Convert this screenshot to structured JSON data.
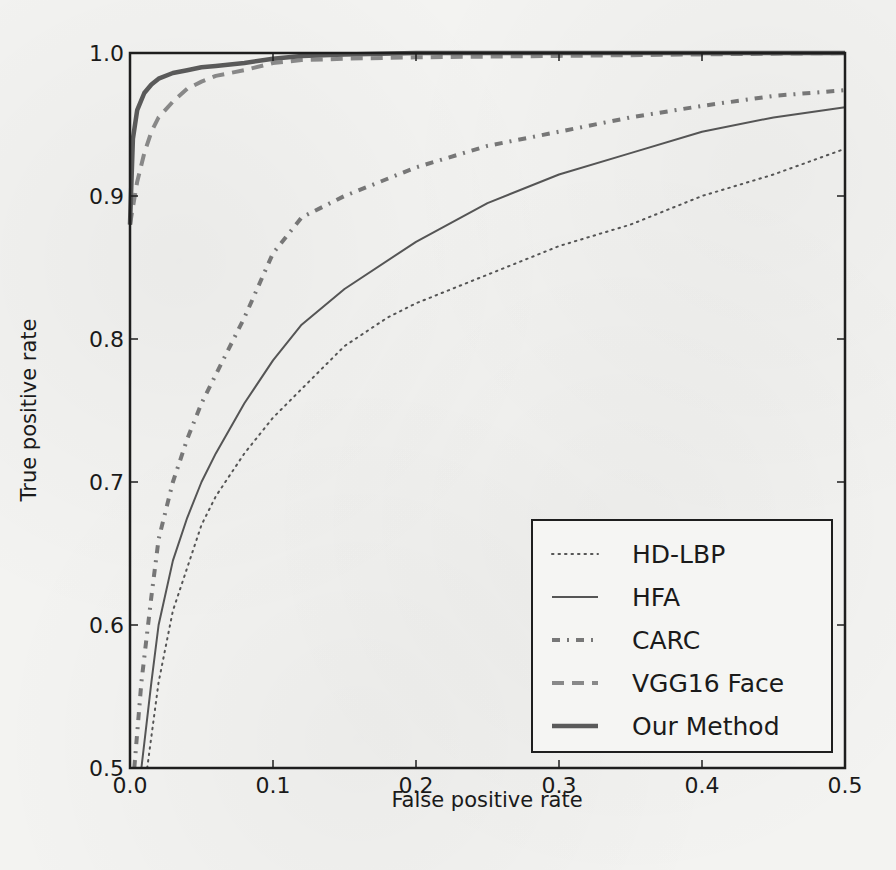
{
  "chart_data": {
    "type": "line",
    "title": "",
    "xlabel": "False positive rate",
    "ylabel": "True positive rate",
    "xlim": [
      0.0,
      0.5
    ],
    "ylim": [
      0.5,
      1.0
    ],
    "xticks": [
      "0.0",
      "0.1",
      "0.2",
      "0.3",
      "0.4",
      "0.5"
    ],
    "yticks": [
      "0.5",
      "0.6",
      "0.7",
      "0.8",
      "0.9",
      "1.0"
    ],
    "grid": false,
    "legend_position": "lower right",
    "series": [
      {
        "name": "HD-LBP",
        "style": "dotted",
        "color": "#555555",
        "x": [
          0.012,
          0.02,
          0.03,
          0.04,
          0.05,
          0.06,
          0.08,
          0.1,
          0.12,
          0.15,
          0.18,
          0.2,
          0.25,
          0.3,
          0.35,
          0.4,
          0.45,
          0.5
        ],
        "y": [
          0.5,
          0.56,
          0.61,
          0.64,
          0.67,
          0.69,
          0.72,
          0.745,
          0.765,
          0.795,
          0.815,
          0.825,
          0.845,
          0.865,
          0.88,
          0.9,
          0.915,
          0.933
        ]
      },
      {
        "name": "HFA",
        "style": "solid",
        "color": "#555555",
        "x": [
          0.008,
          0.015,
          0.02,
          0.03,
          0.04,
          0.05,
          0.06,
          0.08,
          0.1,
          0.12,
          0.15,
          0.2,
          0.25,
          0.3,
          0.35,
          0.4,
          0.45,
          0.5
        ],
        "y": [
          0.5,
          0.56,
          0.6,
          0.645,
          0.675,
          0.7,
          0.72,
          0.755,
          0.785,
          0.81,
          0.835,
          0.868,
          0.895,
          0.915,
          0.93,
          0.945,
          0.955,
          0.962
        ]
      },
      {
        "name": "CARC",
        "style": "dashdot",
        "color": "#777777",
        "x": [
          0.003,
          0.008,
          0.015,
          0.02,
          0.03,
          0.04,
          0.05,
          0.06,
          0.08,
          0.1,
          0.12,
          0.15,
          0.2,
          0.25,
          0.3,
          0.35,
          0.4,
          0.45,
          0.5
        ],
        "y": [
          0.5,
          0.56,
          0.62,
          0.66,
          0.7,
          0.73,
          0.755,
          0.775,
          0.815,
          0.86,
          0.885,
          0.9,
          0.92,
          0.935,
          0.945,
          0.955,
          0.963,
          0.97,
          0.974
        ]
      },
      {
        "name": "VGG16 Face",
        "style": "dashed",
        "color": "#888888",
        "x": [
          0.0,
          0.005,
          0.01,
          0.015,
          0.02,
          0.03,
          0.04,
          0.05,
          0.06,
          0.08,
          0.1,
          0.12,
          0.15,
          0.2,
          0.3,
          0.4,
          0.5
        ],
        "y": [
          0.88,
          0.91,
          0.93,
          0.945,
          0.955,
          0.966,
          0.975,
          0.98,
          0.984,
          0.988,
          0.993,
          0.995,
          0.996,
          0.997,
          0.998,
          0.999,
          1.0
        ]
      },
      {
        "name": "Our Method",
        "style": "solid-thick",
        "color": "#5a5a5a",
        "x": [
          0.0,
          0.002,
          0.005,
          0.01,
          0.015,
          0.02,
          0.03,
          0.04,
          0.05,
          0.06,
          0.08,
          0.1,
          0.12,
          0.15,
          0.2,
          0.3,
          0.4,
          0.5
        ],
        "y": [
          0.88,
          0.94,
          0.96,
          0.972,
          0.978,
          0.982,
          0.986,
          0.988,
          0.99,
          0.991,
          0.993,
          0.996,
          0.998,
          0.999,
          1.0,
          1.0,
          1.0,
          1.0
        ]
      }
    ]
  }
}
